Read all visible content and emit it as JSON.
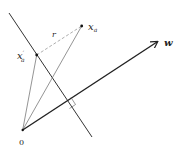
{
  "diagram": {
    "labels": {
      "origin": "0",
      "point": "x",
      "point_sub": "a",
      "projection": "x",
      "projection_sup": "′",
      "projection_sub": "a",
      "distance": "r",
      "vector": "w"
    },
    "colors": {
      "line": "#222222",
      "thin_line": "#555555",
      "dashed": "#888888",
      "background": "#ffffff"
    }
  }
}
